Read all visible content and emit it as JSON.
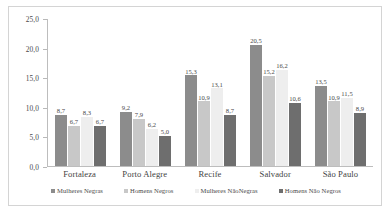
{
  "chart_data": {
    "type": "bar",
    "title": "",
    "subtitle": "",
    "xlabel": "",
    "ylabel": "",
    "ylim": [
      0.0,
      25.0
    ],
    "y_ticks": [
      "0,0",
      "5,0",
      "10,0",
      "15,0",
      "20,0",
      "25,0"
    ],
    "y_tick_values": [
      0.0,
      5.0,
      10.0,
      15.0,
      20.0,
      25.0
    ],
    "grid": false,
    "legend_position": "bottom",
    "decimal_separator": ",",
    "categories": [
      "Fortaleza",
      "Porto Alegre",
      "Recife",
      "Salvador",
      "São Paulo"
    ],
    "series": [
      {
        "name": "Mulheres Negras",
        "color": "#8c8c8c",
        "values": [
          8.7,
          9.2,
          15.3,
          20.5,
          13.5
        ],
        "labels": [
          "8,7",
          "9,2",
          "15,3",
          "20,5",
          "13,5"
        ]
      },
      {
        "name": "Homens Negros",
        "color": "#c8c8c8",
        "values": [
          6.7,
          7.9,
          10.9,
          15.2,
          10.9
        ],
        "labels": [
          "6,7",
          "7,9",
          "10,9",
          "15,2",
          "10,9"
        ]
      },
      {
        "name": "Mulheres NãoNegras",
        "color": "#eeeeee",
        "values": [
          8.3,
          6.2,
          13.1,
          16.2,
          11.5
        ],
        "labels": [
          "8,3",
          "6,2",
          "13,1",
          "16,2",
          "11,5"
        ]
      },
      {
        "name": "Homens Não Negros",
        "color": "#6e6e6e",
        "values": [
          6.7,
          5.0,
          8.7,
          10.6,
          8.9
        ],
        "labels": [
          "6,7",
          "5,0",
          "8,7",
          "10,6",
          "8,9"
        ]
      }
    ]
  },
  "legend": {
    "items": [
      {
        "label": "Mulheres Negras",
        "color": "#8c8c8c"
      },
      {
        "label": "Homens Negros",
        "color": "#c8c8c8"
      },
      {
        "label": "Mulheres  NãoNegras",
        "color": "#eeeeee"
      },
      {
        "label": "Homens Não Negros",
        "color": "#6e6e6e"
      }
    ]
  }
}
